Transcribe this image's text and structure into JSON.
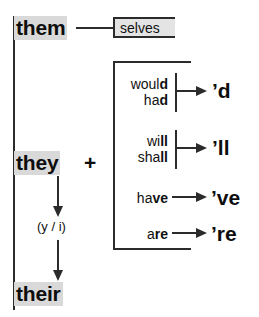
{
  "diagram": {
    "colors": {
      "ink": "#2b2b2b",
      "text": "#111111",
      "highlight": "#d9d9d9",
      "background": "#ffffff"
    }
  },
  "stems": {
    "them": "them",
    "they": "they",
    "their": "their",
    "plus": "+"
  },
  "selves": {
    "label": "selves"
  },
  "vowel_note": {
    "label": "(y / i)"
  },
  "contractions": [
    {
      "id": "d",
      "sources_plain": [
        "woul",
        "ha"
      ],
      "sources_bold": [
        "d",
        "d"
      ],
      "source_line_1": "would",
      "source_line_2": "had",
      "result": "’d"
    },
    {
      "id": "ll",
      "sources_plain": [
        "wi",
        "sha"
      ],
      "sources_bold": [
        "ll",
        "ll"
      ],
      "source_line_1": "will",
      "source_line_2": "shall",
      "result": "’ll"
    },
    {
      "id": "ve",
      "sources_plain": [
        "ha"
      ],
      "sources_bold": [
        "ve"
      ],
      "source_line_1": "have",
      "result": "’ve"
    },
    {
      "id": "re",
      "sources_plain": [
        "a"
      ],
      "sources_bold": [
        "re"
      ],
      "source_line_1": "are",
      "result": "’re"
    }
  ]
}
